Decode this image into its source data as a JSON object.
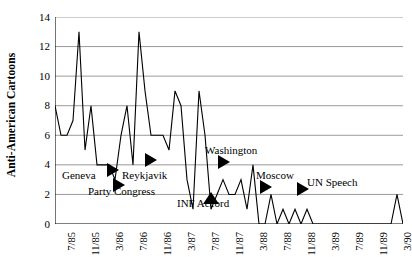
{
  "chart_data": {
    "type": "line",
    "title": "",
    "xlabel": "",
    "ylabel": "Anti-American Cartoons",
    "ylim": [
      0,
      14
    ],
    "ytick_values": [
      0,
      2,
      4,
      6,
      8,
      10,
      12,
      14
    ],
    "ytick_labels": [
      "0",
      "2",
      "4",
      "6",
      "8",
      "10",
      "12",
      "14"
    ],
    "grid": true,
    "grid_axis": "y",
    "legend": "none",
    "xtick_labels": [
      "7/85",
      "11/85",
      "3/86",
      "7/86",
      "11/86",
      "3/87",
      "7/87",
      "11/87",
      "3/88",
      "7/88",
      "11/88",
      "3/89",
      "7/89",
      "11/89",
      "3/90"
    ],
    "xtick_indices": [
      2,
      6,
      10,
      14,
      18,
      22,
      26,
      30,
      34,
      38,
      42,
      46,
      50,
      54,
      58
    ],
    "x_label_period": "monthly",
    "series": [
      {
        "name": "Anti-American Cartoons",
        "color": "#000000",
        "values": [
          8,
          6,
          6,
          7,
          13,
          5,
          8,
          4,
          4,
          4,
          3,
          6,
          8,
          4,
          13,
          9,
          6,
          6,
          6,
          5,
          9,
          8,
          3,
          1,
          9,
          6,
          1,
          2,
          3,
          2,
          2,
          3,
          1,
          4,
          0,
          0,
          2,
          0,
          1,
          0,
          1,
          0,
          1,
          0,
          0,
          0,
          0,
          0,
          0,
          0,
          0,
          0,
          0,
          0,
          0,
          0,
          0,
          2,
          0
        ]
      }
    ],
    "annotations": [
      {
        "label": "Geneva",
        "marker": "right-triangle"
      },
      {
        "label": "Party Congress",
        "marker": "right-triangle"
      },
      {
        "label": "Reykjavik",
        "marker": "right-triangle"
      },
      {
        "label": "INF Accord",
        "marker": "up-triangle"
      },
      {
        "label": "Washington",
        "marker": "right-triangle"
      },
      {
        "label": "Moscow",
        "marker": "right-triangle"
      },
      {
        "label": "UN Speech",
        "marker": "right-triangle"
      }
    ]
  },
  "axis": {
    "y_title": "Anti-American Cartoons"
  },
  "colors": {
    "line": "#000000",
    "grid": "#808080",
    "axis": "#000000",
    "background": "#ffffff"
  }
}
